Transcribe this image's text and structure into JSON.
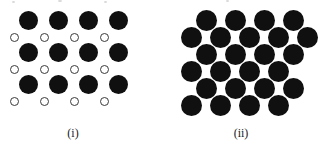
{
  "figure": {
    "background_color": "#ffffff",
    "width": 320,
    "height": 148
  },
  "colors": {
    "filled_atom": "#101010",
    "open_atom_fill": "#ffffff",
    "open_atom_stroke": "#3a3a3a",
    "label_text": "#1a1a1a"
  },
  "panels": [
    {
      "id": "panel-i",
      "label": "(i)",
      "label_x": 73,
      "label_y": 126,
      "description": "Square lattice of large filled circles with small open circles in the interstitial positions",
      "atoms": [
        {
          "type": "filled",
          "cx": 28,
          "cy": 20,
          "d": 19
        },
        {
          "type": "filled",
          "cx": 58,
          "cy": 20,
          "d": 19
        },
        {
          "type": "filled",
          "cx": 88,
          "cy": 20,
          "d": 19
        },
        {
          "type": "filled",
          "cx": 118,
          "cy": 20,
          "d": 19
        },
        {
          "type": "open",
          "cx": 14,
          "cy": 37,
          "d": 9
        },
        {
          "type": "open",
          "cx": 44,
          "cy": 37,
          "d": 9
        },
        {
          "type": "open",
          "cx": 74,
          "cy": 37,
          "d": 9
        },
        {
          "type": "open",
          "cx": 104,
          "cy": 37,
          "d": 9
        },
        {
          "type": "filled",
          "cx": 28,
          "cy": 52,
          "d": 19
        },
        {
          "type": "filled",
          "cx": 58,
          "cy": 52,
          "d": 19
        },
        {
          "type": "filled",
          "cx": 88,
          "cy": 52,
          "d": 19
        },
        {
          "type": "filled",
          "cx": 118,
          "cy": 52,
          "d": 19
        },
        {
          "type": "open",
          "cx": 14,
          "cy": 69,
          "d": 9
        },
        {
          "type": "open",
          "cx": 44,
          "cy": 69,
          "d": 9
        },
        {
          "type": "open",
          "cx": 74,
          "cy": 69,
          "d": 9
        },
        {
          "type": "open",
          "cx": 104,
          "cy": 69,
          "d": 9
        },
        {
          "type": "filled",
          "cx": 28,
          "cy": 84,
          "d": 19
        },
        {
          "type": "filled",
          "cx": 58,
          "cy": 84,
          "d": 19
        },
        {
          "type": "filled",
          "cx": 88,
          "cy": 84,
          "d": 19
        },
        {
          "type": "filled",
          "cx": 118,
          "cy": 84,
          "d": 19
        },
        {
          "type": "open",
          "cx": 14,
          "cy": 101,
          "d": 9
        },
        {
          "type": "open",
          "cx": 44,
          "cy": 101,
          "d": 9
        },
        {
          "type": "open",
          "cx": 74,
          "cy": 101,
          "d": 9
        },
        {
          "type": "open",
          "cx": 104,
          "cy": 101,
          "d": 9
        }
      ]
    },
    {
      "id": "panel-ii",
      "label": "(ii)",
      "label_x": 241,
      "label_y": 126,
      "description": "Hexagonal close-packed array of equal filled circles, six rows alternating four and five atoms",
      "atoms": [
        {
          "type": "filled",
          "cx": 206,
          "cy": 20,
          "d": 21
        },
        {
          "type": "filled",
          "cx": 235,
          "cy": 20,
          "d": 21
        },
        {
          "type": "filled",
          "cx": 264,
          "cy": 20,
          "d": 21
        },
        {
          "type": "filled",
          "cx": 293,
          "cy": 20,
          "d": 21
        },
        {
          "type": "filled",
          "cx": 191,
          "cy": 37,
          "d": 21
        },
        {
          "type": "filled",
          "cx": 220,
          "cy": 37,
          "d": 21
        },
        {
          "type": "filled",
          "cx": 249,
          "cy": 37,
          "d": 21
        },
        {
          "type": "filled",
          "cx": 278,
          "cy": 37,
          "d": 21
        },
        {
          "type": "filled",
          "cx": 307,
          "cy": 37,
          "d": 21
        },
        {
          "type": "filled",
          "cx": 206,
          "cy": 54,
          "d": 21
        },
        {
          "type": "filled",
          "cx": 235,
          "cy": 54,
          "d": 21
        },
        {
          "type": "filled",
          "cx": 264,
          "cy": 54,
          "d": 21
        },
        {
          "type": "filled",
          "cx": 293,
          "cy": 54,
          "d": 21
        },
        {
          "type": "filled",
          "cx": 191,
          "cy": 71,
          "d": 21
        },
        {
          "type": "filled",
          "cx": 220,
          "cy": 71,
          "d": 21
        },
        {
          "type": "filled",
          "cx": 249,
          "cy": 71,
          "d": 21
        },
        {
          "type": "filled",
          "cx": 278,
          "cy": 71,
          "d": 21
        },
        {
          "type": "filled",
          "cx": 206,
          "cy": 88,
          "d": 21
        },
        {
          "type": "filled",
          "cx": 235,
          "cy": 88,
          "d": 21
        },
        {
          "type": "filled",
          "cx": 264,
          "cy": 88,
          "d": 21
        },
        {
          "type": "filled",
          "cx": 293,
          "cy": 88,
          "d": 21
        },
        {
          "type": "filled",
          "cx": 191,
          "cy": 105,
          "d": 21
        },
        {
          "type": "filled",
          "cx": 220,
          "cy": 105,
          "d": 21
        },
        {
          "type": "filled",
          "cx": 249,
          "cy": 105,
          "d": 21
        },
        {
          "type": "filled",
          "cx": 278,
          "cy": 105,
          "d": 21
        }
      ]
    }
  ],
  "scan_artifacts": [
    {
      "x": 12,
      "y": 1,
      "w": 3,
      "h": 2
    },
    {
      "x": 58,
      "y": 0,
      "w": 4,
      "h": 2
    },
    {
      "x": 104,
      "y": 1,
      "w": 3,
      "h": 2
    },
    {
      "x": 226,
      "y": 0,
      "w": 3,
      "h": 2
    }
  ]
}
